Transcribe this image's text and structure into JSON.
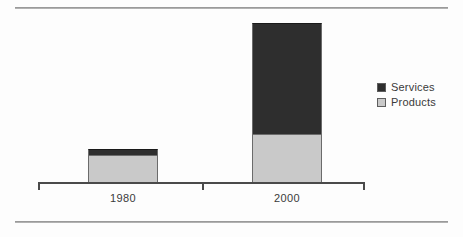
{
  "figure": {
    "background_color": "#fdfdfd",
    "rules": [
      {
        "name": "top-rule",
        "color": "#9a9a9a"
      },
      {
        "name": "bottom-rule",
        "color": "#9a9a9a"
      }
    ]
  },
  "chart_data": {
    "type": "bar",
    "stacked": true,
    "title": "",
    "subtitle": "",
    "xlabel": "",
    "ylabel": "",
    "categories": [
      "1980",
      "2000"
    ],
    "series": [
      {
        "name": "Services",
        "color": "#2e2e2e",
        "values": [
          6,
          111
        ]
      },
      {
        "name": "Products",
        "color": "#c9c9c9",
        "values": [
          28,
          49
        ]
      }
    ],
    "totals": [
      34,
      160
    ],
    "ylim": [
      0,
      160
    ],
    "grid": false,
    "legend_position": "right",
    "axis": {
      "baseline_color": "#4a4a4a",
      "tick_labels": [
        "1980",
        "2000"
      ],
      "ticks_visible": true,
      "y_axis_visible": false,
      "y_tick_labels": []
    },
    "annotations": []
  },
  "legend": {
    "entries": [
      {
        "label": "Services",
        "swatch_color": "#2e2e2e"
      },
      {
        "label": "Products",
        "swatch_color": "#c9c9c9"
      }
    ]
  }
}
